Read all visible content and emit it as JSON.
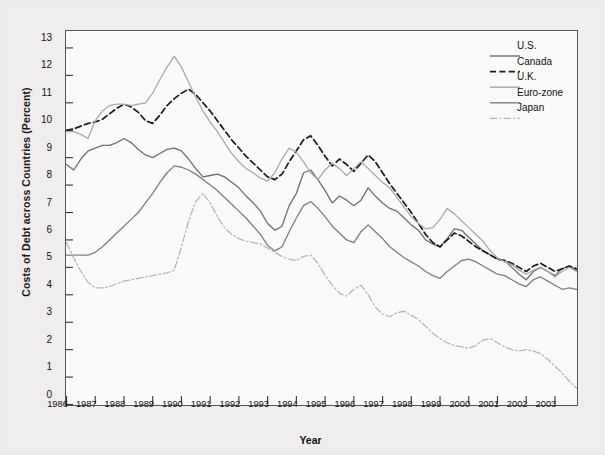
{
  "chart_data": {
    "type": "line",
    "title": "",
    "xlabel": "Year",
    "ylabel": "Costs of Debt across Countries (Percent)",
    "xlim": [
      1986,
      2003.75
    ],
    "ylim": [
      0,
      13.6
    ],
    "yticks": [
      0,
      1,
      2,
      3,
      4,
      5,
      6,
      7,
      8,
      9,
      10,
      11,
      12,
      13
    ],
    "xticks": [
      1986,
      1987,
      1988,
      1989,
      1990,
      1991,
      1992,
      1993,
      1994,
      1995,
      1996,
      1997,
      1998,
      1999,
      2000,
      2001,
      2002,
      2003
    ],
    "grid": false,
    "legend_position": "top-right",
    "x_step_years": 0.25,
    "series": [
      {
        "name": "U.S.",
        "color": "#6f6f6f",
        "dash": "none",
        "values": [
          8.75,
          8.55,
          8.95,
          9.25,
          9.35,
          9.45,
          9.45,
          9.55,
          9.7,
          9.55,
          9.3,
          9.1,
          9.0,
          9.15,
          9.3,
          9.35,
          9.25,
          8.95,
          8.6,
          8.3,
          8.35,
          8.4,
          8.3,
          8.1,
          7.9,
          7.6,
          7.35,
          7.05,
          6.6,
          6.35,
          6.5,
          7.25,
          7.7,
          8.45,
          8.55,
          8.2,
          7.8,
          7.35,
          7.6,
          7.45,
          7.25,
          7.45,
          7.9,
          7.6,
          7.35,
          7.15,
          7.05,
          6.8,
          6.55,
          6.35,
          6.0,
          5.85,
          5.75,
          6.05,
          6.4,
          6.35,
          6.1,
          5.85,
          5.6,
          5.45,
          5.3,
          5.25,
          5.0,
          4.75,
          4.55,
          4.85,
          5.0,
          4.85,
          4.7,
          4.95,
          5.05,
          4.9
        ]
      },
      {
        "name": "Canada",
        "color": "#1a1a1a",
        "dash": "dashed",
        "values": [
          10.0,
          10.05,
          10.15,
          10.25,
          10.3,
          10.4,
          10.6,
          10.8,
          10.95,
          10.85,
          10.65,
          10.35,
          10.25,
          10.55,
          10.9,
          11.15,
          11.35,
          11.5,
          11.3,
          11.0,
          10.7,
          10.35,
          10.0,
          9.65,
          9.35,
          9.05,
          8.8,
          8.55,
          8.3,
          8.2,
          8.4,
          8.85,
          9.25,
          9.65,
          9.8,
          9.45,
          9.05,
          8.7,
          8.95,
          8.75,
          8.5,
          8.8,
          9.1,
          8.85,
          8.45,
          8.05,
          7.7,
          7.35,
          7.0,
          6.6,
          6.2,
          5.9,
          5.75,
          6.0,
          6.25,
          6.15,
          5.95,
          5.75,
          5.6,
          5.45,
          5.3,
          5.25,
          5.15,
          5.0,
          4.85,
          5.05,
          5.15,
          5.0,
          4.85,
          4.95,
          5.05,
          4.95
        ]
      },
      {
        "name": "U.K.",
        "color": "#a8a8a8",
        "dash": "none",
        "values": [
          9.95,
          9.95,
          9.85,
          9.7,
          10.35,
          10.7,
          10.9,
          10.95,
          10.95,
          10.9,
          10.95,
          11.0,
          11.35,
          11.85,
          12.3,
          12.7,
          12.3,
          11.75,
          11.2,
          10.7,
          10.3,
          9.95,
          9.55,
          9.15,
          8.85,
          8.6,
          8.45,
          8.25,
          8.15,
          8.45,
          8.95,
          9.35,
          9.2,
          8.85,
          8.45,
          8.2,
          8.55,
          8.8,
          8.6,
          8.35,
          8.6,
          8.85,
          8.6,
          8.35,
          8.1,
          7.9,
          7.55,
          7.2,
          6.85,
          6.6,
          6.4,
          6.45,
          6.75,
          7.15,
          6.95,
          6.7,
          6.45,
          6.2,
          5.95,
          5.6,
          5.35,
          5.2,
          5.1,
          4.9,
          4.75,
          4.9,
          5.0,
          4.85,
          4.65,
          4.85,
          5.0,
          4.85
        ]
      },
      {
        "name": "Euro-zone",
        "color": "#7d7d7d",
        "dash": "none",
        "values": [
          5.45,
          5.45,
          5.45,
          5.45,
          5.55,
          5.75,
          6.0,
          6.25,
          6.5,
          6.75,
          7.0,
          7.35,
          7.7,
          8.1,
          8.45,
          8.7,
          8.65,
          8.55,
          8.4,
          8.2,
          8.0,
          7.8,
          7.55,
          7.3,
          7.05,
          6.8,
          6.5,
          6.2,
          5.8,
          5.6,
          5.75,
          6.3,
          6.8,
          7.25,
          7.4,
          7.15,
          6.85,
          6.5,
          6.25,
          6.0,
          5.9,
          6.3,
          6.55,
          6.3,
          6.05,
          5.75,
          5.55,
          5.35,
          5.2,
          5.05,
          4.85,
          4.7,
          4.6,
          4.85,
          5.05,
          5.25,
          5.3,
          5.2,
          5.05,
          4.9,
          4.75,
          4.7,
          4.55,
          4.4,
          4.3,
          4.55,
          4.65,
          4.5,
          4.35,
          4.2,
          4.25,
          4.2
        ]
      },
      {
        "name": "Japan",
        "color": "#b5b5b5",
        "dash": "dashdot",
        "values": [
          5.9,
          5.35,
          4.85,
          4.45,
          4.25,
          4.25,
          4.3,
          4.4,
          4.5,
          4.55,
          4.6,
          4.65,
          4.7,
          4.75,
          4.8,
          4.9,
          5.75,
          6.7,
          7.4,
          7.7,
          7.35,
          6.85,
          6.45,
          6.2,
          6.05,
          5.95,
          5.9,
          5.85,
          5.7,
          5.55,
          5.4,
          5.3,
          5.25,
          5.4,
          5.45,
          5.15,
          4.7,
          4.35,
          4.05,
          3.95,
          4.2,
          4.35,
          4.0,
          3.55,
          3.3,
          3.2,
          3.35,
          3.4,
          3.25,
          3.1,
          2.85,
          2.6,
          2.4,
          2.25,
          2.15,
          2.1,
          2.05,
          2.15,
          2.35,
          2.4,
          2.25,
          2.1,
          2.0,
          1.95,
          2.0,
          1.95,
          1.85,
          1.65,
          1.4,
          1.15,
          0.85,
          0.6
        ]
      }
    ]
  },
  "axis": {
    "ytick_labels": [
      "0",
      "1",
      "2",
      "3",
      "4",
      "5",
      "6",
      "7",
      "8",
      "9",
      "10",
      "11",
      "12",
      "13"
    ],
    "xtick_labels": [
      "1986",
      "1987",
      "1988",
      "1989",
      "1990",
      "1991",
      "1992",
      "1993",
      "1994",
      "1995",
      "1996",
      "1997",
      "1998",
      "1999",
      "2000",
      "2001",
      "2002",
      "2003"
    ],
    "y_title": "Costs of Debt across Countries (Percent)",
    "x_title": "Year"
  },
  "legend": {
    "items": [
      {
        "label": "U.S."
      },
      {
        "label": "Canada"
      },
      {
        "label": "U.K."
      },
      {
        "label": "Euro-zone"
      },
      {
        "label": "Japan"
      }
    ]
  }
}
